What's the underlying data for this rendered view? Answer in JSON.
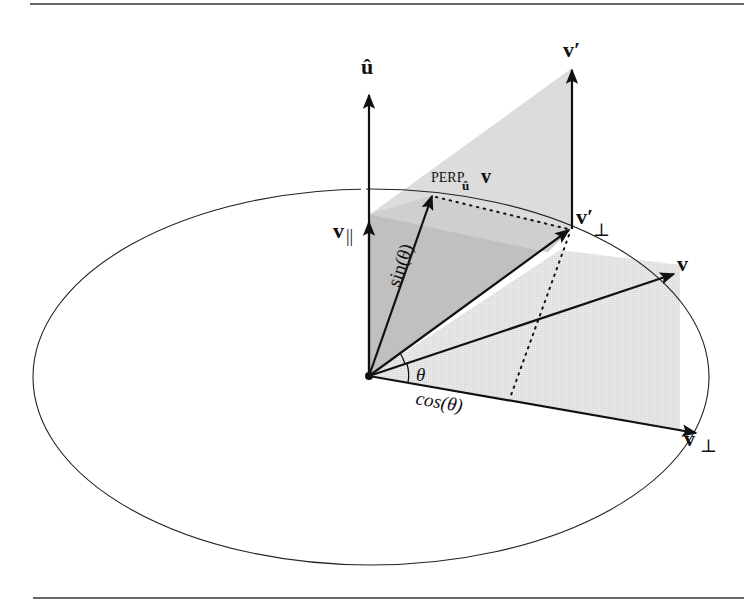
{
  "figure": {
    "colors": {
      "ink": "#111111",
      "plane_light": "#e6e6e6",
      "plane_vertical": "#d9d9d9",
      "plane_dark": "#bdbdbd",
      "background": "#ffffff"
    },
    "labels": {
      "u_hat": "û",
      "v_prime": "v′",
      "v_parallel_base": "v",
      "v_parallel_sub": "||",
      "perp_main": "PERP",
      "perp_sub": "û",
      "perp_v": "v",
      "v_prime_perp_base": "v′",
      "v_prime_perp_sub": "⊥",
      "v": "v",
      "v_perp_base": "v",
      "v_perp_sub": "⊥",
      "sin_theta": "sin(θ)",
      "cos_theta": "cos(θ)",
      "theta": "θ"
    },
    "vectors": [
      {
        "name": "u-hat",
        "from": [
          369,
          376
        ],
        "to": [
          369,
          93
        ]
      },
      {
        "name": "v-parallel",
        "from": [
          369,
          376
        ],
        "to": [
          369,
          222
        ]
      },
      {
        "name": "perp-u-v",
        "from": [
          369,
          376
        ],
        "to": [
          432,
          194
        ]
      },
      {
        "name": "v-prime-perp",
        "from": [
          369,
          376
        ],
        "to": [
          571,
          229
        ]
      },
      {
        "name": "v",
        "from": [
          369,
          376
        ],
        "to": [
          676,
          273
        ]
      },
      {
        "name": "v-perp",
        "from": [
          369,
          376
        ],
        "to": [
          698,
          433
        ]
      },
      {
        "name": "v-prime",
        "from": [
          572,
          228
        ],
        "to": [
          572,
          68
        ]
      }
    ],
    "ellipse": {
      "cx": 371,
      "cy": 377,
      "rx": 338,
      "ry": 188
    }
  }
}
